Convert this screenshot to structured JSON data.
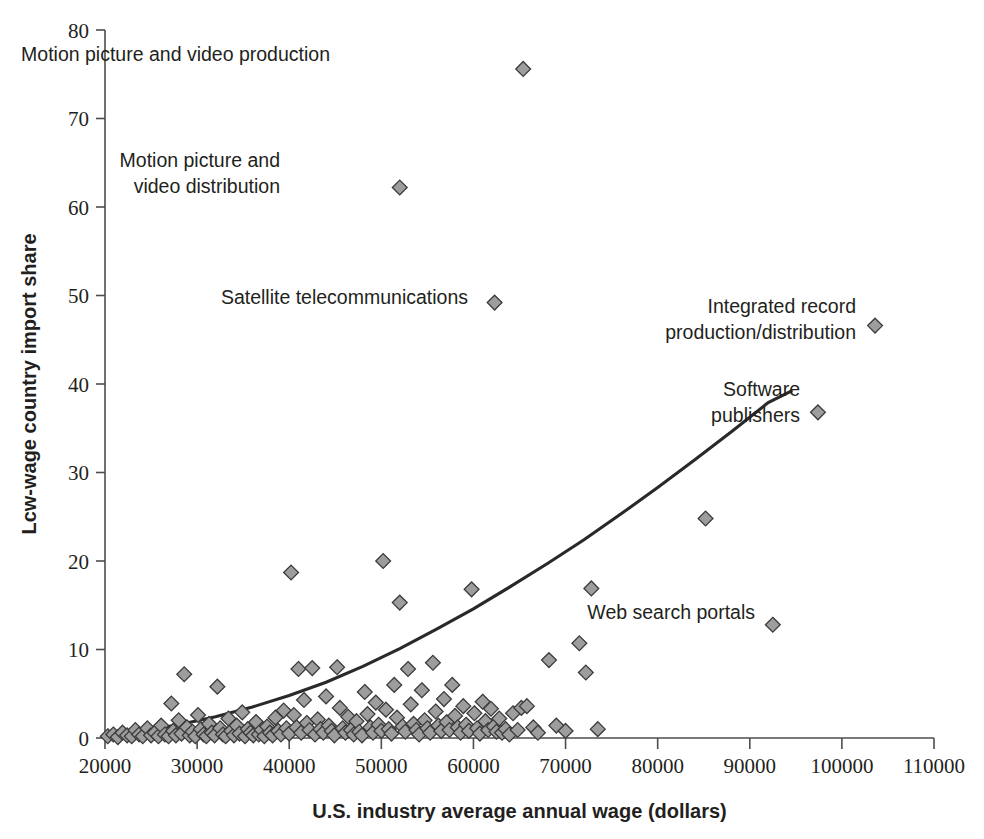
{
  "chart_data": {
    "type": "scatter",
    "title": "",
    "xlabel": "U.S. industry average annual wage (dollars)",
    "ylabel": "Lcw-wage country import share",
    "xlim": [
      20000,
      110000
    ],
    "ylim": [
      0,
      80
    ],
    "xticks": [
      20000,
      30000,
      40000,
      50000,
      60000,
      70000,
      80000,
      90000,
      100000,
      110000
    ],
    "yticks": [
      0,
      10,
      20,
      30,
      40,
      50,
      60,
      70,
      80
    ],
    "xtick_labels": [
      "20000",
      "30000",
      "40000",
      "50000",
      "60000",
      "70000",
      "80000",
      "90000",
      "100000",
      "110000"
    ],
    "ytick_labels": [
      "0",
      "10",
      "20",
      "30",
      "40",
      "50",
      "60",
      "70",
      "80"
    ],
    "grid": false,
    "legend": "none",
    "marker": "diamond",
    "marker_fill": "#9d9d9d",
    "marker_edge": "#3c3a3b",
    "trend_line": {
      "label": "fitted trend curve",
      "color": "#2b2829",
      "points": [
        [
          20000,
          0.3
        ],
        [
          24000,
          0.8
        ],
        [
          28000,
          1.5
        ],
        [
          32000,
          2.4
        ],
        [
          36000,
          3.5
        ],
        [
          40000,
          4.8
        ],
        [
          44000,
          6.3
        ],
        [
          48000,
          8.1
        ],
        [
          52000,
          10.1
        ],
        [
          56000,
          12.3
        ],
        [
          60000,
          14.6
        ],
        [
          64000,
          17.1
        ],
        [
          68000,
          19.7
        ],
        [
          72000,
          22.4
        ],
        [
          76000,
          25.3
        ],
        [
          80000,
          28.3
        ],
        [
          84000,
          31.4
        ],
        [
          88000,
          34.6
        ],
        [
          92000,
          37.9
        ],
        [
          94500,
          39.2
        ]
      ]
    },
    "annotations": [
      {
        "text": "Motion picture and video production",
        "lines": [
          "Motion picture and video production"
        ],
        "x": 65400,
        "y": 75.6,
        "label_x": 330,
        "label_y": 76.5,
        "align": "end"
      },
      {
        "text": "Motion picture and video distribution",
        "lines": [
          "Motion picture and",
          "video distribution"
        ],
        "x": 52000,
        "y": 62.2,
        "label_x": 280,
        "label_y": 64.5,
        "align": "end"
      },
      {
        "text": "Satellite telecommunications",
        "lines": [
          "Satellite telecommunications"
        ],
        "x": 62300,
        "y": 49.2,
        "label_x": 468,
        "label_y": 49.0,
        "align": "end"
      },
      {
        "text": "Integrated record production/distribution",
        "lines": [
          "Integrated record",
          "production/distribution"
        ],
        "x": 103600,
        "y": 46.6,
        "label_x": 856,
        "label_y": 48.0,
        "align": "end"
      },
      {
        "text": "Software publishers",
        "lines": [
          "Software",
          "publishers"
        ],
        "x": 97400,
        "y": 36.8,
        "label_x": 800,
        "label_y": 38.6,
        "align": "end"
      },
      {
        "text": "Web search portals",
        "lines": [
          "Web search portals"
        ],
        "x": 92500,
        "y": 12.8,
        "label_x": 755,
        "label_y": 13.4,
        "align": "end"
      }
    ],
    "highlighted_points": [
      {
        "name": "Motion picture and video production",
        "x": 65400,
        "y": 75.6
      },
      {
        "name": "Motion picture and video distribution",
        "x": 52000,
        "y": 62.2
      },
      {
        "name": "Satellite telecommunications",
        "x": 62300,
        "y": 49.2
      },
      {
        "name": "Integrated record production/distribution",
        "x": 103600,
        "y": 46.6
      },
      {
        "name": "Software publishers",
        "x": 97400,
        "y": 36.8
      },
      {
        "name": "Web search portals",
        "x": 92500,
        "y": 12.8
      }
    ],
    "points": [
      [
        20300,
        0.2
      ],
      [
        20900,
        0.4
      ],
      [
        21400,
        0.1
      ],
      [
        21900,
        0.6
      ],
      [
        22400,
        0.3
      ],
      [
        22900,
        0.2
      ],
      [
        23300,
        0.9
      ],
      [
        23700,
        0.4
      ],
      [
        24100,
        0.2
      ],
      [
        24600,
        1.1
      ],
      [
        25000,
        0.3
      ],
      [
        25400,
        0.6
      ],
      [
        25800,
        0.2
      ],
      [
        26100,
        1.4
      ],
      [
        26500,
        0.4
      ],
      [
        26900,
        0.2
      ],
      [
        27200,
        3.9
      ],
      [
        27400,
        0.8
      ],
      [
        27700,
        0.3
      ],
      [
        28000,
        2.0
      ],
      [
        28300,
        0.5
      ],
      [
        28600,
        7.2
      ],
      [
        28900,
        1.2
      ],
      [
        29200,
        0.3
      ],
      [
        29500,
        0.7
      ],
      [
        29800,
        0.2
      ],
      [
        30100,
        2.6
      ],
      [
        30400,
        1.0
      ],
      [
        30700,
        0.4
      ],
      [
        31000,
        0.2
      ],
      [
        31300,
        1.6
      ],
      [
        31600,
        0.6
      ],
      [
        31900,
        0.3
      ],
      [
        32200,
        5.8
      ],
      [
        32500,
        1.1
      ],
      [
        32800,
        0.4
      ],
      [
        33100,
        0.2
      ],
      [
        33400,
        2.2
      ],
      [
        33700,
        0.8
      ],
      [
        34000,
        0.3
      ],
      [
        34300,
        1.4
      ],
      [
        34600,
        0.5
      ],
      [
        34900,
        2.9
      ],
      [
        35200,
        0.2
      ],
      [
        35500,
        1.0
      ],
      [
        35800,
        0.6
      ],
      [
        36100,
        0.3
      ],
      [
        36400,
        1.8
      ],
      [
        36700,
        0.4
      ],
      [
        37000,
        0.9
      ],
      [
        37300,
        0.2
      ],
      [
        37600,
        1.3
      ],
      [
        37900,
        0.6
      ],
      [
        38200,
        0.3
      ],
      [
        38500,
        2.3
      ],
      [
        38800,
        0.8
      ],
      [
        39100,
        0.4
      ],
      [
        39400,
        3.1
      ],
      [
        39700,
        1.1
      ],
      [
        40000,
        0.5
      ],
      [
        40200,
        18.7
      ],
      [
        40500,
        2.6
      ],
      [
        40800,
        1.2
      ],
      [
        41000,
        7.8
      ],
      [
        41300,
        0.6
      ],
      [
        41600,
        4.3
      ],
      [
        41900,
        1.7
      ],
      [
        42200,
        0.9
      ],
      [
        42500,
        7.9
      ],
      [
        42800,
        0.4
      ],
      [
        43100,
        2.1
      ],
      [
        43400,
        1.0
      ],
      [
        43700,
        0.6
      ],
      [
        44000,
        4.7
      ],
      [
        44300,
        1.4
      ],
      [
        44600,
        0.8
      ],
      [
        44900,
        0.3
      ],
      [
        45200,
        8.0
      ],
      [
        45500,
        3.4
      ],
      [
        45800,
        1.1
      ],
      [
        46100,
        0.6
      ],
      [
        46400,
        2.4
      ],
      [
        46700,
        0.9
      ],
      [
        47000,
        0.4
      ],
      [
        47300,
        1.9
      ],
      [
        47600,
        0.7
      ],
      [
        47900,
        0.3
      ],
      [
        48200,
        5.2
      ],
      [
        48500,
        2.7
      ],
      [
        48800,
        1.2
      ],
      [
        49100,
        0.6
      ],
      [
        49400,
        4.0
      ],
      [
        49700,
        1.5
      ],
      [
        50000,
        0.8
      ],
      [
        50200,
        20.0
      ],
      [
        50500,
        3.2
      ],
      [
        50800,
        1.0
      ],
      [
        51100,
        0.5
      ],
      [
        51400,
        6.0
      ],
      [
        51700,
        2.3
      ],
      [
        52000,
        15.3
      ],
      [
        52300,
        1.3
      ],
      [
        52600,
        0.7
      ],
      [
        52900,
        7.8
      ],
      [
        53200,
        3.8
      ],
      [
        53500,
        1.6
      ],
      [
        53800,
        0.9
      ],
      [
        54100,
        0.4
      ],
      [
        54400,
        5.4
      ],
      [
        54700,
        2.0
      ],
      [
        55000,
        1.1
      ],
      [
        55300,
        0.6
      ],
      [
        55600,
        8.5
      ],
      [
        55900,
        3.0
      ],
      [
        56200,
        1.4
      ],
      [
        56500,
        0.8
      ],
      [
        56800,
        4.4
      ],
      [
        57100,
        1.8
      ],
      [
        57400,
        0.9
      ],
      [
        57700,
        6.0
      ],
      [
        58000,
        2.5
      ],
      [
        58300,
        1.2
      ],
      [
        58600,
        0.6
      ],
      [
        58900,
        3.6
      ],
      [
        59200,
        1.5
      ],
      [
        59500,
        0.8
      ],
      [
        59800,
        16.8
      ],
      [
        60100,
        2.8
      ],
      [
        60400,
        1.1
      ],
      [
        60700,
        0.5
      ],
      [
        61000,
        4.1
      ],
      [
        61300,
        1.9
      ],
      [
        61600,
        0.9
      ],
      [
        61900,
        3.3
      ],
      [
        62200,
        1.3
      ],
      [
        62500,
        0.7
      ],
      [
        62800,
        2.2
      ],
      [
        63100,
        0.6
      ],
      [
        63500,
        1.0
      ],
      [
        63900,
        0.4
      ],
      [
        64300,
        2.8
      ],
      [
        64800,
        0.9
      ],
      [
        65200,
        3.4
      ],
      [
        65800,
        3.6
      ],
      [
        66500,
        1.2
      ],
      [
        67000,
        0.6
      ],
      [
        68200,
        8.8
      ],
      [
        69000,
        1.4
      ],
      [
        70000,
        0.8
      ],
      [
        71500,
        10.7
      ],
      [
        72200,
        7.4
      ],
      [
        72800,
        16.9
      ],
      [
        73500,
        1.0
      ],
      [
        85200,
        24.8
      ]
    ]
  }
}
